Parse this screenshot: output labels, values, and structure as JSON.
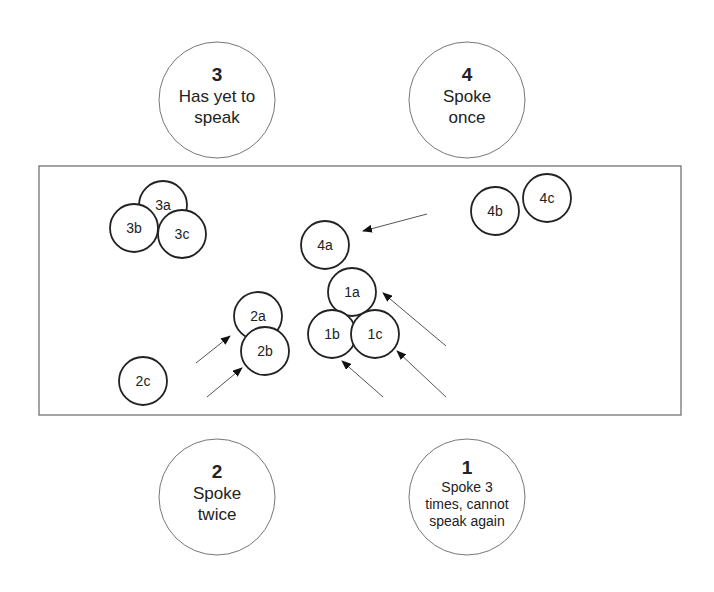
{
  "speakers": [
    {
      "id": "3",
      "number": "3",
      "lines": [
        "Has yet to",
        "speak"
      ],
      "cx": 217,
      "cy": 100
    },
    {
      "id": "4",
      "number": "4",
      "lines": [
        "Spoke",
        "once"
      ],
      "cx": 467,
      "cy": 100
    },
    {
      "id": "2",
      "number": "2",
      "lines": [
        "Spoke",
        "twice"
      ],
      "cx": 217,
      "cy": 497
    },
    {
      "id": "1",
      "number": "1",
      "lines": [
        "Spoke 3",
        "times, cannot",
        "speak again"
      ],
      "cx": 467,
      "cy": 497
    }
  ],
  "statements": [
    {
      "label": "3a",
      "cx": 163,
      "cy": 205
    },
    {
      "label": "3b",
      "cx": 134,
      "cy": 228
    },
    {
      "label": "3c",
      "cx": 182,
      "cy": 234
    },
    {
      "label": "4b",
      "cx": 495,
      "cy": 211
    },
    {
      "label": "4c",
      "cx": 547,
      "cy": 198
    },
    {
      "label": "4a",
      "cx": 325,
      "cy": 245
    },
    {
      "label": "1a",
      "cx": 352,
      "cy": 292
    },
    {
      "label": "1b",
      "cx": 332,
      "cy": 334
    },
    {
      "label": "1c",
      "cx": 375,
      "cy": 334
    },
    {
      "label": "2a",
      "cx": 258,
      "cy": 316
    },
    {
      "label": "2b",
      "cx": 265,
      "cy": 351
    },
    {
      "label": "2c",
      "cx": 143,
      "cy": 381
    }
  ],
  "arrows": [
    {
      "x1": 427,
      "y1": 214,
      "x2": 363,
      "y2": 231
    },
    {
      "x1": 446,
      "y1": 346,
      "x2": 383,
      "y2": 293
    },
    {
      "x1": 446,
      "y1": 397,
      "x2": 397,
      "y2": 351
    },
    {
      "x1": 383,
      "y1": 397,
      "x2": 342,
      "y2": 361
    },
    {
      "x1": 196,
      "y1": 363,
      "x2": 230,
      "y2": 336
    },
    {
      "x1": 207,
      "y1": 397,
      "x2": 242,
      "y2": 368
    }
  ],
  "colors": {
    "stroke": "#222222",
    "thin_stroke": "#777777",
    "arrow": "#555555"
  }
}
